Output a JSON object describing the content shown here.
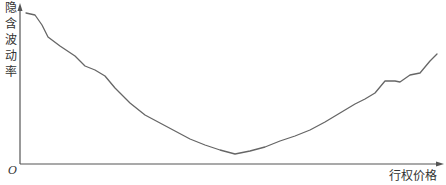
{
  "chart_data": {
    "type": "line",
    "title": "",
    "xlabel": "行权价格",
    "ylabel": "隐含波动率",
    "origin_label": "O",
    "grid": false,
    "legend": null,
    "x_ticks": [],
    "y_ticks": [],
    "series": [
      {
        "name": "隐含波动率曲线",
        "color": "#666666",
        "points_px": [
          [
            26,
            13
          ],
          [
            35,
            15
          ],
          [
            42,
            25
          ],
          [
            48,
            37
          ],
          [
            60,
            46
          ],
          [
            75,
            56
          ],
          [
            85,
            66
          ],
          [
            95,
            70
          ],
          [
            105,
            76
          ],
          [
            115,
            88
          ],
          [
            130,
            103
          ],
          [
            145,
            115
          ],
          [
            160,
            123
          ],
          [
            175,
            131
          ],
          [
            190,
            139
          ],
          [
            205,
            145
          ],
          [
            220,
            150
          ],
          [
            235,
            154
          ],
          [
            250,
            151
          ],
          [
            265,
            147
          ],
          [
            280,
            141
          ],
          [
            295,
            136
          ],
          [
            310,
            130
          ],
          [
            325,
            122
          ],
          [
            340,
            113
          ],
          [
            355,
            104
          ],
          [
            365,
            99
          ],
          [
            375,
            93
          ],
          [
            385,
            81
          ],
          [
            395,
            81
          ],
          [
            400,
            82
          ],
          [
            410,
            75
          ],
          [
            420,
            73
          ],
          [
            430,
            61
          ],
          [
            437,
            54
          ]
        ]
      }
    ]
  },
  "axes": {
    "x_label": "行权价格",
    "y_label_chars": [
      "隐",
      "含",
      "波",
      "动",
      "率"
    ],
    "origin": "O"
  }
}
